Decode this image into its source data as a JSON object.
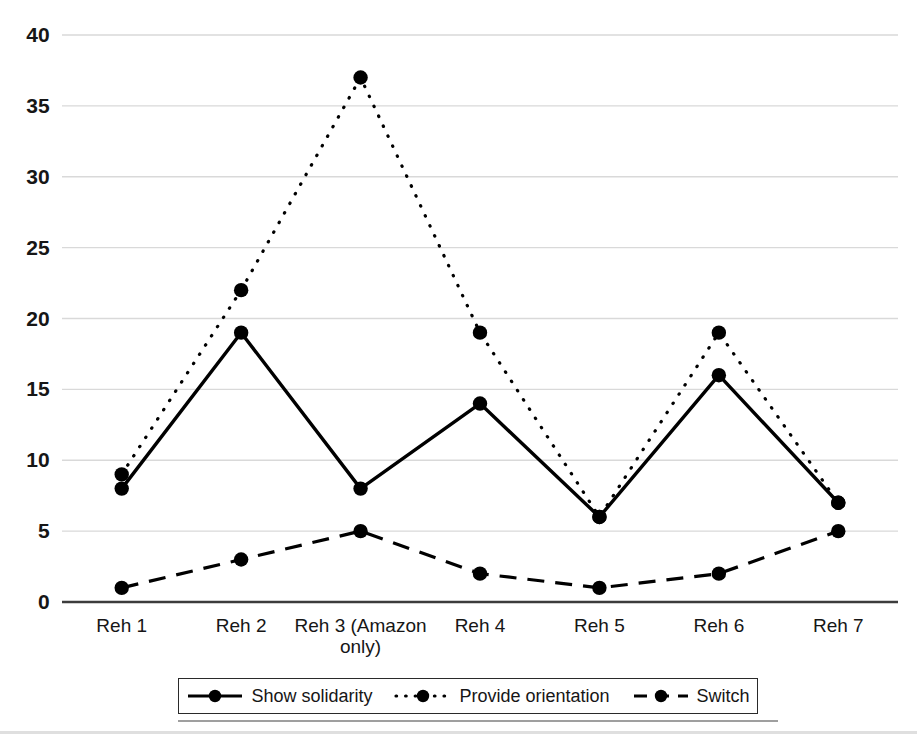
{
  "chart_data": {
    "type": "line",
    "title": "",
    "xlabel": "",
    "ylabel": "",
    "categories": [
      "Reh 1",
      "Reh 2",
      "Reh 3 (Amazon only)",
      "Reh 4",
      "Reh 5",
      "Reh 6",
      "Reh 7"
    ],
    "category_display": [
      "Reh 1",
      "Reh 2",
      "Reh 3 (Amazon\nonly)",
      "Reh 4",
      "Reh 5",
      "Reh 6",
      "Reh 7"
    ],
    "series": [
      {
        "name": "Show solidarity",
        "style": "solid",
        "marker": "circle",
        "color": "#000000",
        "values": [
          8,
          19,
          8,
          14,
          6,
          16,
          7
        ]
      },
      {
        "name": "Provide orientation",
        "style": "dotted",
        "marker": "circle",
        "color": "#000000",
        "values": [
          9,
          22,
          37,
          19,
          6,
          19,
          7
        ]
      },
      {
        "name": "Switch",
        "style": "dashed",
        "marker": "circle",
        "color": "#000000",
        "values": [
          1,
          3,
          5,
          2,
          1,
          2,
          5
        ]
      }
    ],
    "ylim": [
      0,
      40
    ],
    "yticks": [
      0,
      5,
      10,
      15,
      20,
      25,
      30,
      35,
      40
    ],
    "ytick_labels": [
      "0",
      "5",
      "10",
      "15",
      "20",
      "25",
      "30",
      "35",
      "40"
    ],
    "grid": true,
    "grid_color": "#d9d9d9",
    "axis_color": "#3c3c3c",
    "legend_position": "bottom",
    "legend_border": true
  },
  "legend": {
    "entries": [
      {
        "label": "Show solidarity"
      },
      {
        "label": "Provide orientation"
      },
      {
        "label": "Switch"
      }
    ]
  }
}
